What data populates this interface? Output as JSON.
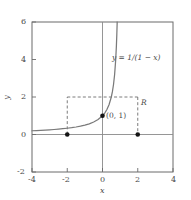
{
  "chart_data": {
    "type": "line",
    "title": "",
    "xlabel": "x",
    "ylabel": "y",
    "xlim": [
      -4,
      4
    ],
    "ylim": [
      -2,
      6
    ],
    "xticks": [
      -4,
      -2,
      0,
      2,
      4
    ],
    "xtick_labels": [
      "-4",
      "-2",
      "0",
      "2",
      "4"
    ],
    "yticks": [
      -2,
      0,
      2,
      4,
      6
    ],
    "ytick_labels": [
      "-2",
      "0",
      "2",
      "4",
      "6"
    ],
    "grid": false,
    "legend": "none",
    "curve_label": "y = 1/(1 − x)",
    "function": "y = 1/(1 - x)",
    "series": [
      {
        "name": "y = 1/(1 - x)",
        "x": [
          -4,
          -3.75,
          -3.5,
          -3.25,
          -3,
          -2.75,
          -2.5,
          -2.25,
          -2,
          -1.75,
          -1.5,
          -1.25,
          -1,
          -0.75,
          -0.5,
          -0.25,
          0,
          0.125,
          0.25,
          0.375,
          0.5,
          0.5625,
          0.625,
          0.6875,
          0.75,
          0.7875,
          0.8125,
          0.833,
          0.8571
        ],
        "y": [
          0.2,
          0.2105,
          0.2222,
          0.2353,
          0.25,
          0.2667,
          0.2857,
          0.3077,
          0.3333,
          0.3636,
          0.4,
          0.4444,
          0.5,
          0.5714,
          0.6667,
          0.8,
          1.0,
          1.1429,
          1.3333,
          1.6,
          2.0,
          2.2857,
          2.6667,
          3.2,
          4.0,
          4.7059,
          5.3333,
          5.988,
          7.0
        ]
      }
    ],
    "points": [
      {
        "label": "(0, 1)",
        "x": 0,
        "y": 1
      },
      {
        "label": "",
        "x": -2,
        "y": 0
      },
      {
        "label": "",
        "x": 2,
        "y": 0
      }
    ],
    "region": {
      "label": "R",
      "x_range": [
        -2,
        2
      ],
      "y_top": 2,
      "style": "dashed"
    },
    "annotations": [
      {
        "text": "y = 1/(1 − x)",
        "x": 1.05,
        "y": 3.3
      },
      {
        "text": "(0, 1)",
        "x": 0.22,
        "y": 0.88
      },
      {
        "text": "R",
        "x": 2.2,
        "y": 1.55
      }
    ],
    "colors": {
      "curve": "#777777",
      "axis": "#888888",
      "frame": "#555555",
      "dashed": "#666666",
      "point": "#111111",
      "text": "#4a4a4a"
    }
  }
}
